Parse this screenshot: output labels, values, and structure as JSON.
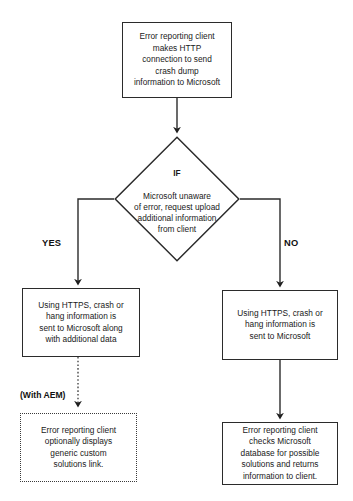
{
  "diagram": {
    "type": "flowchart",
    "colors": {
      "stroke": "#2b2b2b",
      "text": "#1a1a1a",
      "background": "#ffffff",
      "dotted_stroke": "#3a3a3a"
    },
    "nodes": {
      "start": {
        "shape": "rectangle",
        "text": "Error reporting client\nmakes HTTP\nconnection to send\ncrash dump\ninformation to Microsoft"
      },
      "decision": {
        "shape": "diamond",
        "keyword": "IF",
        "text": "Microsoft unaware\nof error, request upload\nadditional information\nfrom client"
      },
      "left_process": {
        "shape": "rectangle",
        "text": "Using HTTPS, crash or\nhang information is\nsent to Microsoft along\nwith additional data"
      },
      "right_process": {
        "shape": "rectangle",
        "text": "Using HTTPS, crash or\nhang information is\nsent to Microsoft"
      },
      "aem_optional": {
        "shape": "rectangle-dotted",
        "text": "Error reporting client\noptionally displays\ngeneric custom\nsolutions link."
      },
      "right_end": {
        "shape": "rectangle",
        "text": "Error reporting client\nchecks Microsoft\ndatabase for possible\nsolutions and returns\ninformation to client."
      }
    },
    "labels": {
      "yes": "YES",
      "no": "NO",
      "with_aem": "(With AEM)"
    },
    "edges": [
      {
        "from": "start",
        "to": "decision",
        "style": "solid",
        "arrow": true
      },
      {
        "from": "decision",
        "to": "left_process",
        "style": "solid",
        "arrow": true,
        "label": "YES"
      },
      {
        "from": "decision",
        "to": "right_process",
        "style": "solid",
        "arrow": true,
        "label": "NO"
      },
      {
        "from": "left_process",
        "to": "aem_optional",
        "style": "dotted",
        "arrow": true,
        "label": "(With AEM)"
      },
      {
        "from": "right_process",
        "to": "right_end",
        "style": "solid",
        "arrow": true
      }
    ]
  }
}
